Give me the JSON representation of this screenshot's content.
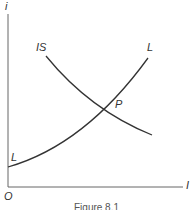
{
  "figure": {
    "caption": "Figure 8.1",
    "y_axis_label": "i",
    "x_axis_label": "I",
    "origin_label": "O",
    "curves": [
      {
        "name": "IS",
        "label": "IS",
        "slope": "downward"
      },
      {
        "name": "L",
        "label": "L",
        "label_lower": "L",
        "slope": "upward"
      }
    ],
    "intersection_label": "P",
    "colors": {
      "axis": "#555555",
      "curve": "#333333",
      "text": "#333333"
    }
  }
}
